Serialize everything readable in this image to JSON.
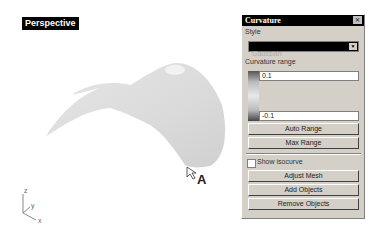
{
  "viewport": {
    "label": "Perspective",
    "axes": {
      "x": "x",
      "y": "y",
      "z": "z"
    },
    "annotation": "A",
    "surface_color": "#dcdcdc"
  },
  "panel": {
    "title": "Curvature",
    "close_icon": "close-icon",
    "style_label": "Style",
    "style_value": "Gaussian",
    "curvature_range_label": "Curvature range",
    "range_max": "0.1",
    "range_min": "-0.1",
    "buttons": {
      "auto_range": "Auto Range",
      "max_range": "Max Range",
      "adjust_mesh": "Adjust Mesh",
      "add_objects": "Add Objects",
      "remove_objects": "Remove Objects"
    },
    "show_isocurve_label": "Show isocurve",
    "show_isocurve_checked": false
  }
}
